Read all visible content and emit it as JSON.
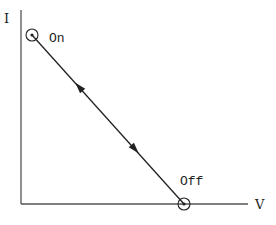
{
  "diagram": {
    "type": "IV load line (switching trajectory)",
    "axes": {
      "y_label": "I",
      "x_label": "V"
    },
    "points": [
      {
        "id": "on",
        "label": "On"
      },
      {
        "id": "off",
        "label": "Off"
      }
    ],
    "edges": [
      {
        "from": "on",
        "to": "off",
        "bidirectional": true
      }
    ],
    "colors": {
      "line": "#222222",
      "axis": "#555555",
      "background": "#ffffff"
    }
  }
}
